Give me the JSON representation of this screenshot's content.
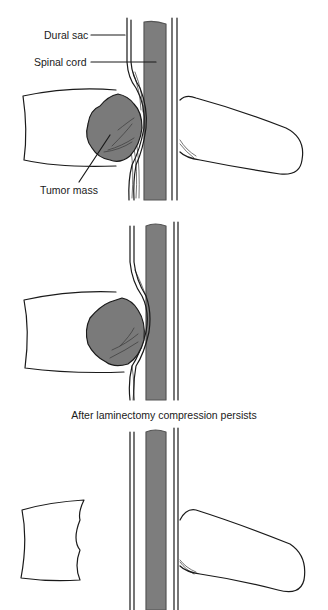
{
  "figure": {
    "colors": {
      "background": "#ffffff",
      "outline": "#1a1a1a",
      "spinal_cord": "#7d7d7d",
      "tumor": "#7a7a7a",
      "tumor_texture": "#4a4a4a"
    },
    "panels": [
      {
        "id": "panel-1",
        "description": "Tumor mass compressing dural sac and spinal cord",
        "labels": {
          "dural_sac": "Dural sac",
          "spinal_cord": "Spinal cord",
          "tumor_mass": "Tumor mass"
        }
      },
      {
        "id": "panel-2",
        "description": "Tumor compressing cord, lamina removed"
      },
      {
        "id": "panel-3",
        "description": "Tumor removed from vertebral body",
        "caption": "After laminectomy compression persists"
      }
    ]
  }
}
